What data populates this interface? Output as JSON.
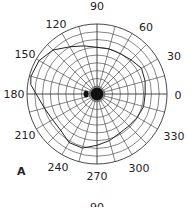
{
  "chart_data": {
    "type": "polar",
    "title": "",
    "panel_label": "A",
    "angle_ticks": [
      0,
      30,
      60,
      90,
      120,
      150,
      180,
      210,
      240,
      270,
      300,
      330
    ],
    "angle_tick_labels": [
      "0",
      "30",
      "60",
      "90",
      "120",
      "150",
      "180",
      "210",
      "240",
      "270",
      "300",
      "330"
    ],
    "radial_rings": 9,
    "radial_max": 90,
    "radial_spokes_step_deg": 15,
    "series": [
      {
        "name": "isopter",
        "points_angle_radius": [
          [
            0,
            62
          ],
          [
            15,
            64
          ],
          [
            30,
            66
          ],
          [
            45,
            62
          ],
          [
            60,
            60
          ],
          [
            75,
            60
          ],
          [
            90,
            60
          ],
          [
            105,
            64
          ],
          [
            120,
            70
          ],
          [
            135,
            80
          ],
          [
            150,
            86
          ],
          [
            165,
            88
          ],
          [
            172,
            86
          ],
          [
            195,
            70
          ],
          [
            210,
            66
          ],
          [
            225,
            66
          ],
          [
            240,
            72
          ],
          [
            255,
            72
          ],
          [
            270,
            66
          ],
          [
            285,
            62
          ],
          [
            300,
            58
          ],
          [
            315,
            58
          ],
          [
            330,
            60
          ],
          [
            345,
            62
          ]
        ]
      }
    ],
    "blind_spot": {
      "angle": 180,
      "radius": 14
    },
    "fixation": {
      "angle": 0,
      "radius": 0
    }
  },
  "labels": {
    "a0": "0",
    "a30": "30",
    "a60": "60",
    "a90": "90",
    "a120": "120",
    "a150": "150",
    "a180": "180",
    "a210": "210",
    "a240": "240",
    "a270": "270",
    "a300": "300",
    "a330": "330",
    "panel": "A",
    "next_partial": "90"
  }
}
